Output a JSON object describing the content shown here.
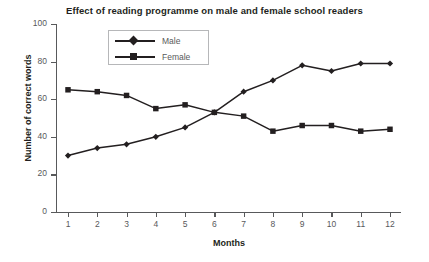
{
  "chart_data": {
    "type": "line",
    "title": "Effect of reading programme on male and female school readers",
    "xlabel": "Months",
    "ylabel": "Number of correct words",
    "categories": [
      "1",
      "2",
      "3",
      "4",
      "5",
      "6",
      "7",
      "8",
      "9",
      "10",
      "11",
      "12"
    ],
    "x": [
      1,
      2,
      3,
      4,
      5,
      6,
      7,
      8,
      9,
      10,
      11,
      12
    ],
    "xlim": [
      1,
      12
    ],
    "ylim": [
      0,
      100
    ],
    "yticks": [
      0,
      20,
      40,
      60,
      80,
      100
    ],
    "grid": false,
    "legend_position": "upper-left-inside",
    "series": [
      {
        "name": "Male",
        "marker": "diamond",
        "color": "#231f20",
        "values": [
          30,
          34,
          36,
          40,
          45,
          53,
          64,
          70,
          78,
          75,
          79,
          79
        ]
      },
      {
        "name": "Female",
        "marker": "square",
        "color": "#231f20",
        "values": [
          65,
          64,
          62,
          55,
          57,
          53,
          51,
          43,
          46,
          46,
          43,
          44
        ]
      }
    ]
  },
  "legend": {
    "items": [
      {
        "label": "Male"
      },
      {
        "label": "Female"
      }
    ]
  }
}
